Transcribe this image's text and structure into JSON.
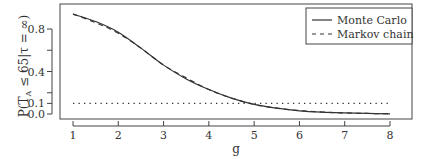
{
  "chart_data": {
    "type": "line",
    "title": "",
    "xlabel": "g",
    "ylabel": "P(T_A ≤ 65 | τ = ∞)",
    "xlim": [
      1,
      8
    ],
    "ylim": [
      0.0,
      0.95
    ],
    "x_ticks": [
      "1",
      "2",
      "3",
      "4",
      "5",
      "6",
      "7",
      "8"
    ],
    "y_ticks": [
      "0.0",
      "0.1",
      "0.4",
      "0.8"
    ],
    "grid": false,
    "legend_position": "top-right",
    "series": [
      {
        "name": "Monte Carlo",
        "style": "solid",
        "x": [
          1,
          1.5,
          2,
          2.5,
          3,
          3.5,
          4,
          4.5,
          5,
          5.5,
          6,
          6.5,
          7,
          7.5,
          8
        ],
        "values": [
          0.94,
          0.87,
          0.77,
          0.62,
          0.46,
          0.33,
          0.23,
          0.15,
          0.09,
          0.055,
          0.03,
          0.017,
          0.01,
          0.005,
          0.002
        ]
      },
      {
        "name": "Markov chain",
        "style": "dashed",
        "x": [
          1,
          1.5,
          2,
          2.5,
          3,
          3.5,
          4,
          4.5,
          5,
          5.5,
          6,
          6.5,
          7,
          7.5,
          8
        ],
        "values": [
          0.94,
          0.86,
          0.76,
          0.62,
          0.46,
          0.34,
          0.23,
          0.15,
          0.09,
          0.055,
          0.032,
          0.018,
          0.01,
          0.005,
          0.002
        ]
      },
      {
        "name": "reference 0.1",
        "style": "dotted",
        "x": [
          1,
          8
        ],
        "values": [
          0.1,
          0.1
        ]
      }
    ]
  },
  "legend": {
    "items": [
      "Monte Carlo",
      "Markov chain"
    ]
  },
  "axes": {
    "xlabel": "g",
    "ylabel_main": "P(T",
    "ylabel_sub": "A",
    "ylabel_rest": " ≤ 65|τ = ∞)"
  }
}
